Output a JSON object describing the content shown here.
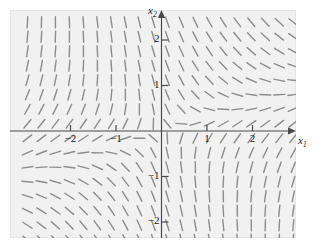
{
  "figure": {
    "kind": "direction-field-plot",
    "background_color": "#ffffff",
    "plot_background_color": "#f1f1f1",
    "plot_border_color": "#e6e6e6",
    "axis_color": "#4a4a4a",
    "segment_color": "#8c8c8c",
    "tick_label_color": "#1a1a1a"
  },
  "axes": {
    "x_label": "x",
    "x_label_sub": "1",
    "y_label": "x",
    "y_label_sub": "2",
    "x_ticks": [
      {
        "value": -2,
        "label": "−2"
      },
      {
        "value": -1,
        "label": "−1"
      },
      {
        "value": 1,
        "label": "1"
      },
      {
        "value": 2,
        "label": "2"
      }
    ],
    "y_ticks": [
      {
        "value": 2,
        "label": "2"
      },
      {
        "value": 1,
        "label": "1"
      },
      {
        "value": -1,
        "label": "−1"
      },
      {
        "value": -2,
        "label": "−2"
      }
    ]
  },
  "chart_data": {
    "type": "scatter",
    "subtype": "direction-field",
    "title": "",
    "xlabel": "x1",
    "ylabel": "x2",
    "xlim": [
      -3.1,
      3.05
    ],
    "ylim": [
      -2.55,
      2.55
    ],
    "grid": false,
    "legend": null,
    "field": {
      "description": "Slope field of a planar autonomous system with a saddle-like structure near the origin; segments drawn on a uniform grid, direction given by dx2/dx1 = f(x1,x2).",
      "vector_x_expression": "x1 + x2",
      "vector_y_expression": "x1 - 3*x2",
      "grid_nx": 20,
      "grid_ny": 16,
      "segment_length_px": 11,
      "segment_width_px": 1.4
    },
    "annotations": [
      {
        "text": "x2",
        "position": "y-axis-top"
      },
      {
        "text": "x1",
        "position": "x-axis-right"
      }
    ]
  }
}
